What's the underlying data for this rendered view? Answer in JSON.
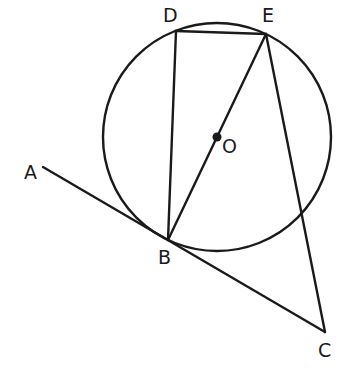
{
  "diagram": {
    "title": "",
    "circle": {
      "center": "O",
      "cx": 217,
      "cy": 137,
      "r": 114
    },
    "points": {
      "A": {
        "x": 43,
        "y": 167,
        "label": "A",
        "lx": 24,
        "ly": 179
      },
      "B": {
        "x": 168,
        "y": 240,
        "label": "B",
        "lx": 158,
        "ly": 264
      },
      "C": {
        "x": 325,
        "y": 332,
        "label": "C",
        "lx": 318,
        "ly": 357
      },
      "D": {
        "x": 176,
        "y": 31,
        "label": "D",
        "lx": 163,
        "ly": 22
      },
      "E": {
        "x": 266,
        "y": 34,
        "label": "E",
        "lx": 262,
        "ly": 22
      },
      "O": {
        "x": 217,
        "y": 137,
        "label": "O",
        "lx": 222,
        "ly": 153
      }
    },
    "segments": [
      {
        "from": "A",
        "to": "C",
        "note": "tangent line through B"
      },
      {
        "from": "D",
        "to": "E"
      },
      {
        "from": "D",
        "to": "B"
      },
      {
        "from": "E",
        "to": "B",
        "note": "diameter through O"
      },
      {
        "from": "E",
        "to": "C"
      }
    ],
    "colors": {
      "ink": "#1a1a1a",
      "background": "#ffffff"
    }
  }
}
